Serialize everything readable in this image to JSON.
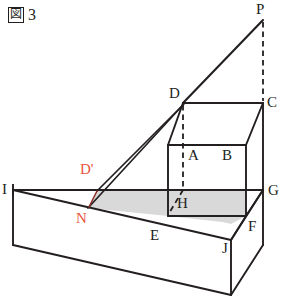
{
  "figure": {
    "caption_mark": "図",
    "caption_number": "3",
    "title": "図 3"
  },
  "colors": {
    "ink": "#231f20",
    "accent": "#e8553c",
    "shade_fill": "#d9d9d9",
    "background": "#ffffff"
  },
  "diagram": {
    "kind": "3d-solid-geometry",
    "vertices": [
      {
        "name": "P",
        "label": "P",
        "x": 263,
        "y": 20,
        "label_x": 256,
        "label_y": 4,
        "color": "ink",
        "hidden": false
      },
      {
        "name": "D",
        "label": "D",
        "x": 183,
        "y": 103,
        "label_x": 170,
        "label_y": 88,
        "color": "ink",
        "hidden": false
      },
      {
        "name": "C",
        "label": "C",
        "x": 263,
        "y": 103,
        "label_x": 267,
        "label_y": 96,
        "color": "ink",
        "hidden": false
      },
      {
        "name": "A",
        "label": "A",
        "x": 183,
        "y": 145,
        "label_x": 188,
        "label_y": 146,
        "color": "ink",
        "hidden": false
      },
      {
        "name": "B",
        "label": "B",
        "x": 246,
        "y": 145,
        "label_x": 222,
        "label_y": 146,
        "color": "ink",
        "hidden": false
      },
      {
        "name": "G",
        "label": "G",
        "x": 263,
        "y": 190,
        "label_x": 267,
        "label_y": 183,
        "color": "ink",
        "hidden": false
      },
      {
        "name": "H",
        "label": "H",
        "x": 183,
        "y": 190,
        "label_x": 176,
        "label_y": 196,
        "color": "ink",
        "hidden": true
      },
      {
        "name": "I",
        "label": "I",
        "x": 13,
        "y": 190,
        "label_x": 2,
        "label_y": 182,
        "color": "ink",
        "hidden": false
      },
      {
        "name": "E",
        "label": "E",
        "x": 168,
        "y": 216,
        "label_x": 150,
        "label_y": 228,
        "color": "ink",
        "hidden": false
      },
      {
        "name": "F",
        "label": "F",
        "x": 246,
        "y": 216,
        "label_x": 248,
        "label_y": 219,
        "color": "ink",
        "hidden": false
      },
      {
        "name": "J",
        "label": "J",
        "x": 231,
        "y": 240,
        "label_x": 222,
        "label_y": 240,
        "color": "ink",
        "hidden": false
      },
      {
        "name": "D'",
        "label": "D'",
        "x": 97,
        "y": 191,
        "label_x": 80,
        "label_y": 163,
        "color": "accent",
        "hidden": false
      },
      {
        "name": "N",
        "label": "N",
        "x": 88,
        "y": 208,
        "label_x": 76,
        "label_y": 211,
        "color": "accent",
        "hidden": false
      }
    ],
    "labels": [
      {
        "text": "P",
        "x": 256,
        "y": 4,
        "accent": false
      },
      {
        "text": "D",
        "x": 170,
        "y": 88,
        "accent": false
      },
      {
        "text": "C",
        "x": 267,
        "y": 96,
        "accent": false
      },
      {
        "text": "A",
        "x": 188,
        "y": 146,
        "accent": false
      },
      {
        "text": "B",
        "x": 222,
        "y": 146,
        "accent": false
      },
      {
        "text": "G",
        "x": 267,
        "y": 183,
        "accent": false
      },
      {
        "text": "H",
        "x": 176,
        "y": 196,
        "accent": false
      },
      {
        "text": "I",
        "x": 2,
        "y": 182,
        "accent": false
      },
      {
        "text": "E",
        "x": 150,
        "y": 228,
        "accent": false
      },
      {
        "text": "F",
        "x": 248,
        "y": 219,
        "accent": false
      },
      {
        "text": "J",
        "x": 222,
        "y": 240,
        "accent": false
      },
      {
        "text": "D'",
        "x": 80,
        "y": 163,
        "accent": true
      },
      {
        "text": "N",
        "x": 76,
        "y": 211,
        "accent": true
      }
    ],
    "shaded_regions": [
      {
        "name": "section-plane-shade",
        "points": "88,208 97,191 168,191 168,216"
      },
      {
        "name": "slab-top-right-shade",
        "points": "168,216 168,191 246,191 246,216 231,223"
      }
    ],
    "solid_edges": [
      {
        "name": "edge-D-P",
        "from": "D",
        "to": "P"
      },
      {
        "name": "edge-D-C",
        "from": "D",
        "to": "C"
      },
      {
        "name": "edge-C-B",
        "from": "C",
        "to": "B"
      },
      {
        "name": "edge-C-G",
        "from": "C",
        "to": "G"
      },
      {
        "name": "edge-A-B",
        "from": "A",
        "to": "B"
      },
      {
        "name": "edge-A-E",
        "from": "A",
        "to": "E"
      },
      {
        "name": "edge-B-F",
        "from": "B",
        "to": "F"
      },
      {
        "name": "edge-E-F",
        "from": "E",
        "to": "F"
      },
      {
        "name": "edge-D-A",
        "from": "D",
        "to": "A"
      },
      {
        "name": "edge-F-G",
        "from": "F",
        "to": "G"
      },
      {
        "name": "edge-F-J",
        "from": "F",
        "to": "J"
      },
      {
        "name": "edge-I-G",
        "from": "I",
        "to": "G"
      },
      {
        "name": "edge-I-J",
        "from": "I",
        "to": "J"
      },
      {
        "name": "edge-D-Dp",
        "from": "D",
        "to": "D'"
      },
      {
        "name": "edge-D-N",
        "from": "D",
        "to": "N"
      }
    ],
    "dashed_edges": [
      {
        "name": "dash-P-C",
        "from": "P",
        "to": "C"
      },
      {
        "name": "dash-D-H",
        "from": "D",
        "to": "H"
      },
      {
        "name": "dash-H-G",
        "from": "H",
        "to": "G"
      },
      {
        "name": "dash-H-E",
        "from": "H",
        "to": "E"
      }
    ],
    "slab": {
      "name": "wedge-slab",
      "top_front": "13,190 231,240",
      "bottom_left": "13,190 13,245",
      "bottom_front": "13,245 231,295",
      "right_front": "231,240 231,295",
      "right_back": "231,295 263,263",
      "right_upper": "231,240 263,190"
    }
  }
}
